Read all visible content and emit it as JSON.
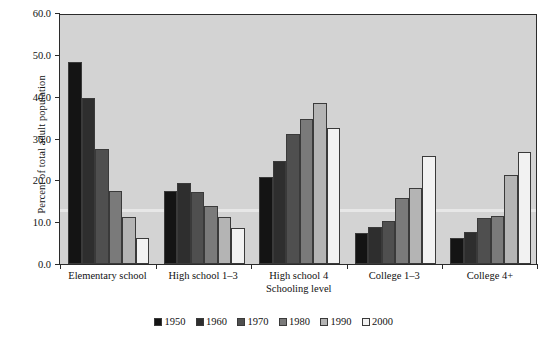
{
  "chart_data": {
    "type": "bar",
    "title": "",
    "xlabel": "Schooling level",
    "ylabel": "Percent of total adult population",
    "categories": [
      "Elementary school",
      "High school 1–3",
      "High school 4",
      "College 1–3",
      "College 4+"
    ],
    "ylim": [
      0.0,
      60.0
    ],
    "ytick_labels": [
      "0.0",
      "10.0",
      "20.0",
      "30.0",
      "40.0",
      "50.0",
      "60.0"
    ],
    "ytick_values": [
      0,
      10,
      20,
      30,
      40,
      50,
      60
    ],
    "grid": false,
    "legend_position": "bottom",
    "series": [
      {
        "name": "1950",
        "color": "#141414",
        "values": [
          48.4,
          17.5,
          20.8,
          7.5,
          6.2
        ]
      },
      {
        "name": "1960",
        "color": "#2e2e2e",
        "values": [
          39.8,
          19.4,
          24.6,
          8.8,
          7.7
        ]
      },
      {
        "name": "1970",
        "color": "#4f4f4f",
        "values": [
          27.6,
          17.2,
          31.1,
          10.2,
          11.0
        ]
      },
      {
        "name": "1980",
        "color": "#7a7a7a",
        "values": [
          17.5,
          13.9,
          34.6,
          15.7,
          11.5
        ]
      },
      {
        "name": "1990",
        "color": "#b4b4b4",
        "values": [
          11.2,
          11.2,
          38.4,
          18.2,
          21.3
        ]
      },
      {
        "name": "2000",
        "color": "#f2f2f2",
        "values": [
          6.2,
          8.5,
          32.4,
          25.8,
          26.7
        ]
      }
    ]
  },
  "axes": {
    "plot_background": "#d3d3d3",
    "frame_color": "#2b2b2b"
  }
}
